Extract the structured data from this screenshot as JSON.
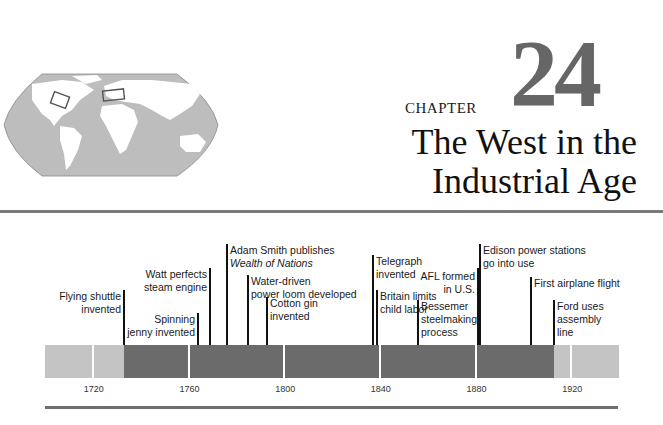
{
  "chapter": {
    "label": "CHAPTER",
    "number": "24",
    "title_line_1": "The West in the",
    "title_line_2": "Industrial Age"
  },
  "map": {
    "icon": "world-map-icon",
    "highlighted_regions": [
      "North America (eastern United States)",
      "Western Europe (Britain)"
    ]
  },
  "timeline": {
    "start_year": 1700,
    "end_year": 1940,
    "years": [
      "1720",
      "1760",
      "1800",
      "1840",
      "1880",
      "1920"
    ],
    "colors": {
      "light": "#c4c4c4",
      "dark": "#6b6b6b",
      "tick": "#111111"
    },
    "period_highlight": {
      "from": 1733,
      "to": 1913
    },
    "events": [
      {
        "label_1": "Flying shuttle",
        "label_2": "invented",
        "label_2_italic": false,
        "year": 1733,
        "side": "left"
      },
      {
        "label_1": "Spinning",
        "label_2": "jenny invented",
        "label_2_italic": false,
        "year": 1764,
        "side": "left"
      },
      {
        "label_1": "Watt perfects",
        "label_2": "steam engine",
        "label_2_italic": false,
        "year": 1769,
        "side": "left"
      },
      {
        "label_1": "Adam Smith publishes",
        "label_2": "Wealth of Nations",
        "label_2_italic": true,
        "year": 1776,
        "side": "right"
      },
      {
        "label_1": "Water-driven",
        "label_2": "power loom developed",
        "label_2_italic": false,
        "year": 1785,
        "side": "right"
      },
      {
        "label_1": "Cotton gin",
        "label_2": "invented",
        "label_2_italic": false,
        "year": 1793,
        "side": "right"
      },
      {
        "label_1": "Telegraph",
        "label_2": "invented",
        "label_2_italic": false,
        "year": 1837,
        "side": "right"
      },
      {
        "label_1": "Britain limits",
        "label_2": "child labor",
        "label_2_italic": false,
        "year": 1839,
        "side": "right"
      },
      {
        "label_1": "Bessemer",
        "label_2": "steelmaking",
        "label_3": "process",
        "label_2_italic": false,
        "year": 1856,
        "side": "right"
      },
      {
        "label_1": "AFL formed",
        "label_2": "in U.S.",
        "label_2_italic": false,
        "year": 1881,
        "side": "left"
      },
      {
        "label_1": "Edison power stations",
        "label_2": "go into use",
        "label_2_italic": false,
        "year": 1882,
        "side": "right"
      },
      {
        "label_1": "First airplane flight",
        "label_2": "",
        "label_2_italic": false,
        "year": 1903,
        "side": "right"
      },
      {
        "label_1": "Ford uses",
        "label_2": "assembly",
        "label_3": "line",
        "label_2_italic": false,
        "year": 1913,
        "side": "right"
      }
    ]
  }
}
